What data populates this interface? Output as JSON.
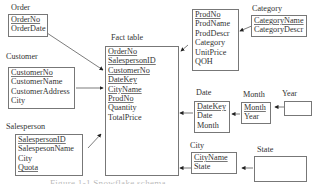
{
  "diagram": {
    "type": "snowflake-schema",
    "tables": {
      "order": {
        "title": "Order",
        "fields": [
          "OrderNo",
          "OrderDate"
        ],
        "keys": [
          "OrderNo"
        ]
      },
      "customer": {
        "title": "Customer",
        "fields": [
          "CustomerNo",
          "CustomerName",
          "CustomerAddress",
          "City"
        ],
        "keys": [
          "CustomerNo"
        ]
      },
      "salesperson": {
        "title": "Salesperson",
        "fields": [
          "SalespersonID",
          "SalespesonName",
          "City",
          "Quota"
        ],
        "keys": [
          "SalespersonID"
        ]
      },
      "fact": {
        "title": "Fact table",
        "fields": [
          "OrderNo",
          "SalespersonID",
          "CustomerNo",
          "DateKey",
          "CityName",
          "ProdNo",
          "Quantity",
          "TotalPrice"
        ],
        "keys": [
          "OrderNo",
          "SalespersonID",
          "CustomerNo",
          "DateKey",
          "CityName",
          "ProdNo"
        ]
      },
      "product": {
        "title": "",
        "fields": [
          "ProdNo",
          "ProdName",
          "ProdDescr",
          "Category",
          "UnitPrice",
          "QOH"
        ],
        "keys": [
          "ProdNo"
        ]
      },
      "category": {
        "title": "Category",
        "fields": [
          "CategoryName",
          "CategoryDescr"
        ],
        "keys": [
          "CategoryName"
        ]
      },
      "date": {
        "title": "Date",
        "fields": [
          "DateKey",
          "Date",
          "Month"
        ],
        "keys": [
          "DateKey"
        ]
      },
      "month": {
        "title": "Month",
        "fields": [
          "Month",
          "Year"
        ],
        "keys": [
          "Month"
        ]
      },
      "year": {
        "title": "Year",
        "fields": [],
        "keys": []
      },
      "city": {
        "title": "City",
        "fields": [
          "CityName",
          "State"
        ],
        "keys": [
          "CityName"
        ]
      },
      "state": {
        "title": "State",
        "fields": [],
        "keys": []
      }
    },
    "relationships": [
      {
        "from": "order",
        "to": "fact"
      },
      {
        "from": "customer",
        "to": "fact"
      },
      {
        "from": "salesperson",
        "to": "fact"
      },
      {
        "from": "product",
        "to": "fact"
      },
      {
        "from": "category",
        "to": "product"
      },
      {
        "from": "date",
        "to": "fact"
      },
      {
        "from": "month",
        "to": "date"
      },
      {
        "from": "year",
        "to": "month"
      },
      {
        "from": "city",
        "to": "fact"
      },
      {
        "from": "state",
        "to": "city"
      }
    ],
    "caption": "Figure 1-1 Snowflake schema"
  }
}
